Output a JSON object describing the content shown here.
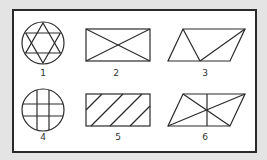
{
  "colors": {
    "background": "#e4e4e4",
    "frame_border": "#2a2a2a",
    "panel": "#ffffff",
    "stroke": "#2a2a2a"
  },
  "figures": [
    {
      "id": 1,
      "label": "1",
      "shape": "circle with inscribed hexagram (six-pointed star)"
    },
    {
      "id": 2,
      "label": "2",
      "shape": "rectangle with both diagonals"
    },
    {
      "id": 3,
      "label": "3",
      "shape": "parallelogram divided into three triangles"
    },
    {
      "id": 4,
      "label": "4",
      "shape": "circle with two vertical and two horizontal chords (grid)"
    },
    {
      "id": 5,
      "label": "5",
      "shape": "rectangle with four parallel diagonal hatch lines"
    },
    {
      "id": 6,
      "label": "6",
      "shape": "parallelogram with both diagonals and a vertical line through center"
    }
  ]
}
